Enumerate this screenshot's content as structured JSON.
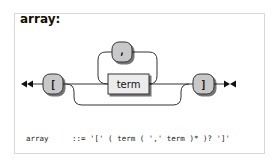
{
  "rule": {
    "name": "array",
    "title": "array:"
  },
  "diagram": {
    "start_marker": "start-double-arrow",
    "end_marker": "end-arrow-bar",
    "terminals": {
      "open": "[",
      "separator": ",",
      "close": "]"
    },
    "nonterminals": {
      "item": "term"
    },
    "colors": {
      "terminal_fill": "#c8c8c8",
      "nonterminal_fill": "#ececec",
      "stroke": "#333333",
      "line": "#333333"
    }
  },
  "ebnf": {
    "lhs": "array",
    "definition": "::= '[' ( term ( ',' term )* )? ']'"
  }
}
